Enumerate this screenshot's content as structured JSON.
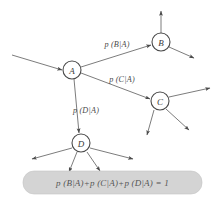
{
  "diagram": {
    "background_color": "#ffffff",
    "edge_color": "#5a5a5a",
    "node_stroke_color": "#4a4a4a",
    "nodes": [
      {
        "id": "A",
        "label": "A",
        "cx": 72,
        "cy": 70,
        "r": 9
      },
      {
        "id": "B",
        "label": "B",
        "cx": 161,
        "cy": 42,
        "r": 9
      },
      {
        "id": "C",
        "label": "C",
        "cx": 160,
        "cy": 101,
        "r": 9
      },
      {
        "id": "D",
        "label": "D",
        "cx": 81,
        "cy": 143,
        "r": 9
      }
    ],
    "edge_labels": [
      {
        "id": "p-b-given-a",
        "text": "p (B|A)",
        "x": 117,
        "y": 44
      },
      {
        "id": "p-c-given-a",
        "text": "p (C|A)",
        "x": 122,
        "y": 79
      },
      {
        "id": "p-d-given-a",
        "text": "p (D|A)",
        "x": 86,
        "y": 110
      }
    ],
    "incoming_arrow": {
      "id": "incoming-edge-to-a",
      "from_x": 12,
      "from_y": 55,
      "to_x": 62,
      "to_y": 70
    },
    "branch_edges": [
      {
        "id": "edge-a-to-b",
        "from": "A",
        "to": "B"
      },
      {
        "id": "edge-a-to-c",
        "from": "A",
        "to": "C"
      },
      {
        "id": "edge-a-to-d",
        "from": "A",
        "to": "D"
      }
    ],
    "leaf_arrows": {
      "B": [
        {
          "id": "b-out-up",
          "x1": 161,
          "y1": 33,
          "x2": 161,
          "y2": 10
        },
        {
          "id": "b-out-lower-right",
          "x1": 169,
          "y1": 47,
          "x2": 195,
          "y2": 58
        }
      ],
      "C": [
        {
          "id": "c-out-right",
          "x1": 169,
          "y1": 97,
          "x2": 211,
          "y2": 88
        },
        {
          "id": "c-out-lower-right",
          "x1": 166,
          "y1": 109,
          "x2": 190,
          "y2": 131
        },
        {
          "id": "c-out-down",
          "x1": 154,
          "y1": 110,
          "x2": 146,
          "y2": 136
        }
      ],
      "D": [
        {
          "id": "d-out-left",
          "x1": 72,
          "y1": 148,
          "x2": 31,
          "y2": 160
        },
        {
          "id": "d-out-right",
          "x1": 90,
          "y1": 148,
          "x2": 134,
          "y2": 160
        },
        {
          "id": "d-out-down-left",
          "x1": 77,
          "y1": 152,
          "x2": 68,
          "y2": 173
        },
        {
          "id": "d-out-down-right",
          "x1": 87,
          "y1": 152,
          "x2": 101,
          "y2": 172
        }
      ]
    },
    "equation_box": {
      "id": "equation-box",
      "x": 23,
      "y": 171,
      "width": 179,
      "height": 23,
      "radius": 11,
      "fill_color": "#d4d4d4",
      "text": "p (B|A)+p (C|A)+p (D|A) = 1"
    }
  }
}
